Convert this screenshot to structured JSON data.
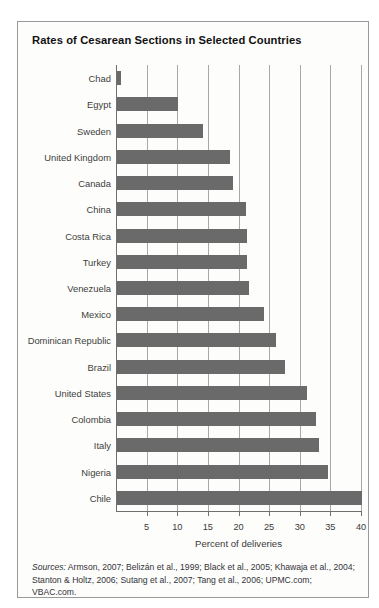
{
  "figure": {
    "title": "Rates of Cesarean Sections in Selected Countries",
    "sources_lead": "Sources:",
    "sources_text": " Armson, 2007; Belizán et al., 1999; Black et al., 2005; Khawaja et al., 2004; Stanton & Holtz, 2006; Sutang et al., 2007; Tang et al., 2006; UPMC.com; VBAC.com.",
    "bar_color": "#6a6a6a",
    "grid_color": "#a8a8a8",
    "axis_color": "#6f6f6f"
  },
  "chart_data": {
    "type": "bar",
    "orientation": "horizontal",
    "title": "Rates of Cesarean Sections in Selected Countries",
    "xlabel": "Percent of deliveries",
    "ylabel": "",
    "xlim": [
      0,
      40
    ],
    "xticks": [
      5,
      10,
      15,
      20,
      25,
      30,
      35,
      40
    ],
    "xtick_labels": [
      "5",
      "10",
      "15",
      "20",
      "25",
      "30",
      "35",
      "40"
    ],
    "grid": true,
    "grid_axis": "x",
    "legend": false,
    "categories": [
      "Chad",
      "Egypt",
      "Sweden",
      "United Kingdom",
      "Canada",
      "China",
      "Costa Rica",
      "Turkey",
      "Venezuela",
      "Mexico",
      "Dominican Republic",
      "Brazil",
      "United States",
      "Colombia",
      "Italy",
      "Nigeria",
      "Chile"
    ],
    "values": [
      0.6,
      10.0,
      14.0,
      18.5,
      19.0,
      21.0,
      21.2,
      21.2,
      21.5,
      24.0,
      26.0,
      27.5,
      31.0,
      32.5,
      33.0,
      34.5,
      40.0
    ]
  }
}
